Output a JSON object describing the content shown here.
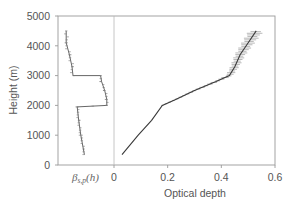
{
  "chart_data": {
    "type": "line",
    "title": "",
    "ylabel": "Height (m)",
    "xlabel": "Optical depth",
    "ylim": [
      0,
      5000
    ],
    "xlim": [
      0,
      0.6
    ],
    "yticks": [
      0,
      1000,
      2000,
      3000,
      4000,
      5000
    ],
    "xticks": [
      0,
      0.2,
      0.4,
      0.6
    ],
    "ytick_labels": [
      "0",
      "1000",
      "2000",
      "3000",
      "4000",
      "5000"
    ],
    "xtick_labels": [
      "0",
      "0.2",
      "0.4",
      "0.6"
    ],
    "grid": false,
    "legend": null,
    "inset_panel_label": "β_{s,p}(h)",
    "series": [
      {
        "name": "β_{s,p}(h) extinction profile (relative units, left panel)",
        "x_units": "relative",
        "points": [
          {
            "h": 350,
            "x": 0.47
          },
          {
            "h": 1000,
            "x": 0.4
          },
          {
            "h": 1500,
            "x": 0.36
          },
          {
            "h": 1950,
            "x": 0.33
          },
          {
            "h": 2000,
            "x": 0.9
          },
          {
            "h": 2200,
            "x": 0.9
          },
          {
            "h": 2500,
            "x": 0.86
          },
          {
            "h": 2800,
            "x": 0.8
          },
          {
            "h": 3000,
            "x": 0.78
          },
          {
            "h": 3000,
            "x": 0.25
          },
          {
            "h": 3300,
            "x": 0.23
          },
          {
            "h": 3700,
            "x": 0.18
          },
          {
            "h": 4100,
            "x": 0.12
          },
          {
            "h": 4500,
            "x": 0.12
          }
        ]
      },
      {
        "name": "Optical depth",
        "points": [
          {
            "h": 350,
            "tau": 0.03
          },
          {
            "h": 1000,
            "tau": 0.09
          },
          {
            "h": 1500,
            "tau": 0.14
          },
          {
            "h": 2000,
            "tau": 0.18
          },
          {
            "h": 2200,
            "tau": 0.23
          },
          {
            "h": 2500,
            "tau": 0.3
          },
          {
            "h": 2800,
            "tau": 0.38
          },
          {
            "h": 3000,
            "tau": 0.43
          },
          {
            "h": 3300,
            "tau": 0.45
          },
          {
            "h": 3700,
            "tau": 0.47
          },
          {
            "h": 4100,
            "tau": 0.5
          },
          {
            "h": 4500,
            "tau": 0.53
          }
        ],
        "error_bars": "horizontal, growing with height (~±0.005 at 2000 m to ~±0.03 at 4500 m)"
      }
    ]
  }
}
